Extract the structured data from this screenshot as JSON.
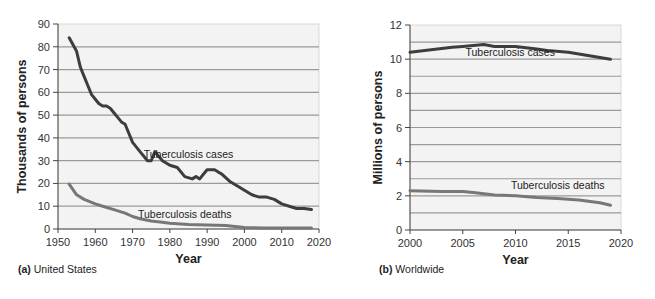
{
  "chart_data": [
    {
      "type": "line",
      "panel_label": "(a)",
      "caption": "United States",
      "xlabel": "Year",
      "ylabel": "Thousands of persons",
      "xlim": [
        1950,
        2020
      ],
      "ylim": [
        0,
        90
      ],
      "xticks": [
        1950,
        1960,
        1970,
        1980,
        1990,
        2000,
        2010,
        2020
      ],
      "yticks": [
        0,
        10,
        20,
        30,
        40,
        50,
        60,
        70,
        80,
        90
      ],
      "grid": true,
      "series": [
        {
          "name": "Tuberculosis cases",
          "x": [
            1953,
            1954,
            1955,
            1956,
            1957,
            1958,
            1959,
            1960,
            1961,
            1962,
            1963,
            1964,
            1965,
            1966,
            1967,
            1968,
            1969,
            1970,
            1972,
            1974,
            1975,
            1976,
            1978,
            1980,
            1982,
            1984,
            1986,
            1987,
            1988,
            1989,
            1990,
            1991,
            1992,
            1993,
            1994,
            1996,
            1998,
            2000,
            2002,
            2004,
            2006,
            2008,
            2010,
            2012,
            2014,
            2016,
            2018
          ],
          "y": [
            84,
            81,
            78,
            71,
            67,
            63,
            59,
            57,
            55,
            54,
            54,
            53,
            51,
            49,
            47,
            46,
            42,
            38,
            34,
            30,
            30,
            34,
            30,
            28,
            27,
            23,
            22,
            23,
            22,
            24,
            26,
            26,
            26,
            25,
            24,
            21,
            19,
            17,
            15,
            14,
            14,
            13,
            11,
            10,
            9,
            9,
            8.5
          ]
        },
        {
          "name": "Tuberculosis deaths",
          "x": [
            1953,
            1955,
            1957,
            1960,
            1962,
            1965,
            1968,
            1970,
            1972,
            1975,
            1978,
            1980,
            1985,
            1990,
            1995,
            2000,
            2005,
            2010,
            2018
          ],
          "y": [
            19.7,
            15,
            13,
            11,
            10,
            8.5,
            7,
            5.5,
            4.5,
            3.5,
            3,
            2.5,
            2,
            1.8,
            1.5,
            0.7,
            0.5,
            0.5,
            0.5
          ]
        }
      ],
      "annotations": [
        {
          "text": "Tuberculosis cases",
          "x": 1985,
          "y": 31
        },
        {
          "text": "Tuberculosis deaths",
          "x": 1984,
          "y": 5
        }
      ]
    },
    {
      "type": "line",
      "panel_label": "(b)",
      "caption": "Worldwide",
      "xlabel": "Year",
      "ylabel": "Millions of persons",
      "xlim": [
        2000,
        2020
      ],
      "ylim": [
        0,
        12
      ],
      "xticks": [
        2000,
        2005,
        2010,
        2015,
        2020
      ],
      "yticks": [
        0,
        2,
        4,
        6,
        8,
        10,
        12
      ],
      "grid": true,
      "series": [
        {
          "name": "Tuberculosis cases",
          "x": [
            2000,
            2002,
            2004,
            2005,
            2007,
            2008,
            2010,
            2012,
            2013,
            2015,
            2017,
            2019
          ],
          "y": [
            10.4,
            10.55,
            10.7,
            10.75,
            10.85,
            10.75,
            10.75,
            10.6,
            10.5,
            10.4,
            10.2,
            10.0
          ]
        },
        {
          "name": "Tuberculosis deaths",
          "x": [
            2000,
            2003,
            2005,
            2006,
            2008,
            2010,
            2012,
            2014,
            2016,
            2018,
            2019
          ],
          "y": [
            2.3,
            2.25,
            2.25,
            2.2,
            2.05,
            2.0,
            1.9,
            1.85,
            1.75,
            1.6,
            1.45
          ]
        }
      ],
      "annotations": [
        {
          "text": "Tuberculosis cases",
          "x": 2009.5,
          "y": 10.2
        },
        {
          "text": "Tuberculosis deaths",
          "x": 2014,
          "y": 2.4
        }
      ]
    }
  ],
  "labels": {
    "a_bold": "(a)",
    "a_text": "United States",
    "b_bold": "(b)",
    "b_text": "Worldwide"
  }
}
